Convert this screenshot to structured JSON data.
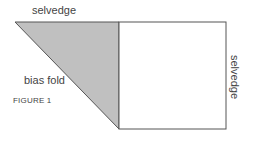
{
  "labels": {
    "top_selvedge": "selvedge",
    "bias_fold": "bias fold",
    "right_selvedge": "selvedge",
    "figure": "FIGURE 1"
  },
  "colors": {
    "triangle_fill": "#c0c0c0",
    "stroke": "#555555"
  }
}
